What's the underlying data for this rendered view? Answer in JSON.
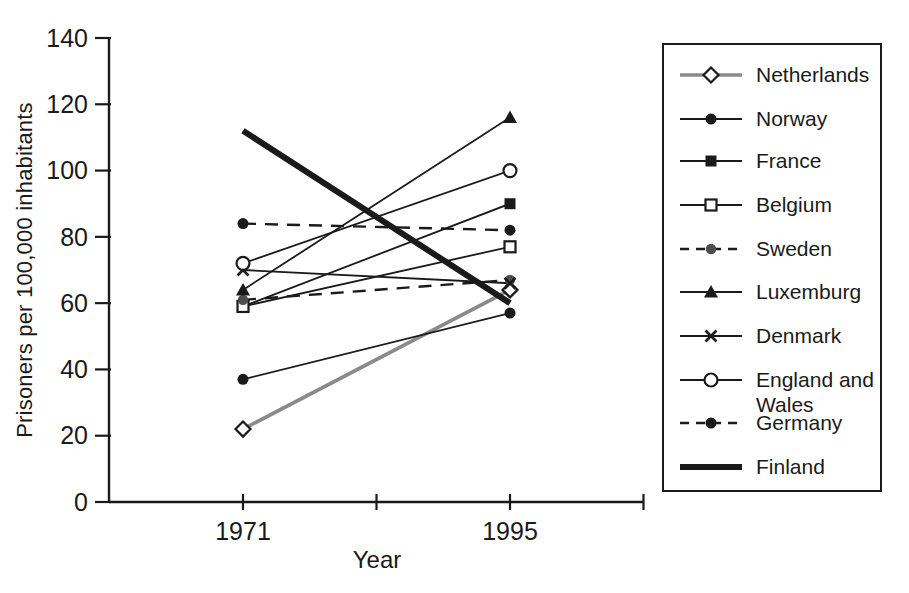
{
  "colors": {
    "ink": "#1a1a1a",
    "background": "#ffffff",
    "netherlands_line": "#8a8a8a",
    "sweden_marker": "#4d4d4d"
  },
  "chart_data": {
    "type": "line",
    "title": "",
    "xlabel": "Year",
    "ylabel": "Prisoners per 100,000 inhabitants",
    "x": [
      1971,
      1995
    ],
    "x_tick_labels": [
      "1971",
      "1995"
    ],
    "y_ticks": [
      0,
      20,
      40,
      60,
      80,
      100,
      120,
      140
    ],
    "ylim": [
      0,
      140
    ],
    "grid": false,
    "legend_position": "right-box",
    "series": [
      {
        "name": "Netherlands",
        "values": [
          22,
          64
        ],
        "marker": "open-diamond",
        "line_style": "solid-gray"
      },
      {
        "name": "Norway",
        "values": [
          37,
          57
        ],
        "marker": "filled-circle",
        "line_style": "solid"
      },
      {
        "name": "France",
        "values": [
          59,
          90
        ],
        "marker": "filled-square",
        "line_style": "solid"
      },
      {
        "name": "Belgium",
        "values": [
          59,
          77
        ],
        "marker": "open-square",
        "line_style": "solid"
      },
      {
        "name": "Sweden",
        "values": [
          61,
          67
        ],
        "marker": "gray-circle",
        "line_style": "dashed"
      },
      {
        "name": "Luxemburg",
        "values": [
          64,
          116
        ],
        "marker": "filled-triangle",
        "line_style": "solid"
      },
      {
        "name": "Denmark",
        "values": [
          70,
          66
        ],
        "marker": "x-cross",
        "line_style": "solid"
      },
      {
        "name": "England and Wales",
        "values": [
          72,
          100
        ],
        "marker": "open-circle",
        "line_style": "solid"
      },
      {
        "name": "Germany",
        "values": [
          84,
          82
        ],
        "marker": "filled-circle",
        "line_style": "dashed"
      },
      {
        "name": "Finland",
        "values": [
          112,
          60
        ],
        "marker": "none",
        "line_style": "thick"
      }
    ]
  }
}
